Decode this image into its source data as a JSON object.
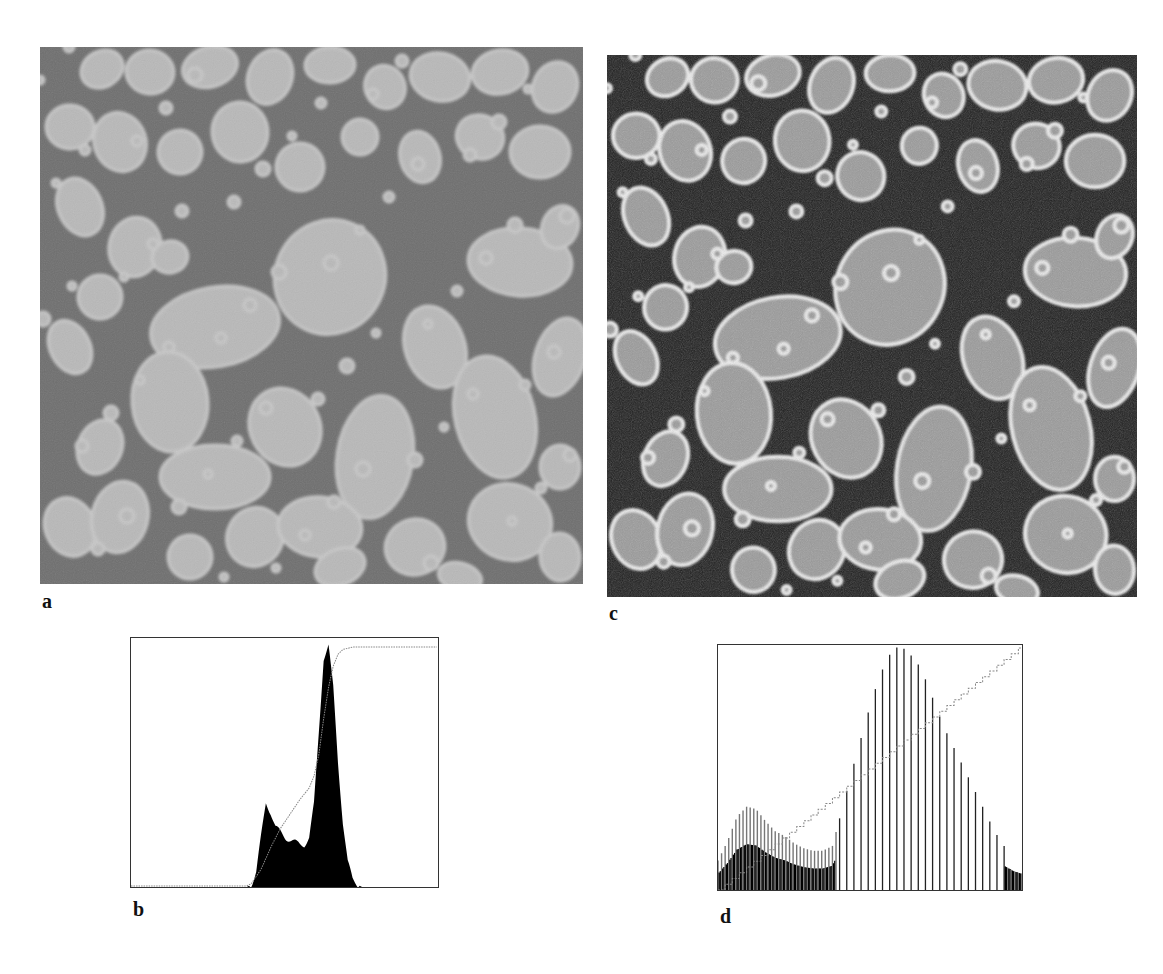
{
  "figure": {
    "panels": [
      {
        "id": "a",
        "label": "a",
        "kind": "micrograph",
        "description": "original grayscale image of grains, low contrast"
      },
      {
        "id": "b",
        "label": "b",
        "kind": "histogram",
        "description": "histogram of image a with cumulative curve"
      },
      {
        "id": "c",
        "label": "c",
        "kind": "micrograph",
        "description": "histogram-equalized image, high contrast"
      },
      {
        "id": "d",
        "label": "d",
        "kind": "histogram",
        "description": "histogram of image c (spiky, equalized) with linear cumulative curve"
      }
    ],
    "colors": {
      "background": "#ffffff",
      "matrix_a": "#6e6e6e",
      "grain_a": "#b9b9b9",
      "grain_edge_a": "#cfcfcf",
      "matrix_c": "#1c1c1c",
      "grain_c": "#9a9a9a",
      "grain_edge_c": "#eeeeee",
      "histogram_fill": "#000000",
      "cumulative_line": "#888888",
      "frame": "#333333"
    }
  },
  "chart_data": [
    {
      "panel": "b",
      "type": "bar",
      "title": "",
      "xlabel": "",
      "ylabel": "",
      "xlim": [
        0,
        255
      ],
      "ylim": [
        0,
        1
      ],
      "grid": false,
      "legend": null,
      "series": [
        {
          "name": "histogram",
          "x": [
            0,
            16,
            32,
            48,
            64,
            80,
            96,
            100,
            104,
            108,
            112,
            116,
            120,
            124,
            128,
            132,
            136,
            140,
            144,
            148,
            152,
            156,
            160,
            164,
            168,
            172,
            176,
            180,
            184,
            188,
            192,
            196,
            200,
            208,
            224,
            240,
            255
          ],
          "values": [
            0,
            0,
            0,
            0,
            0,
            0,
            0,
            0.01,
            0.06,
            0.2,
            0.34,
            0.3,
            0.24,
            0.22,
            0.2,
            0.19,
            0.18,
            0.17,
            0.17,
            0.2,
            0.33,
            0.62,
            0.92,
            0.97,
            0.8,
            0.5,
            0.26,
            0.1,
            0.03,
            0.01,
            0,
            0,
            0,
            0,
            0,
            0,
            0
          ]
        },
        {
          "name": "cumulative",
          "x": [
            0,
            96,
            100,
            108,
            116,
            124,
            132,
            140,
            148,
            152,
            156,
            160,
            164,
            168,
            172,
            176,
            184,
            192,
            208,
            255
          ],
          "values": [
            0,
            0,
            0.01,
            0.07,
            0.16,
            0.24,
            0.3,
            0.36,
            0.41,
            0.46,
            0.55,
            0.7,
            0.83,
            0.92,
            0.97,
            0.99,
            1.0,
            1.0,
            1.0,
            1.0
          ]
        }
      ]
    },
    {
      "panel": "d",
      "type": "bar",
      "title": "",
      "xlabel": "",
      "ylabel": "",
      "xlim": [
        0,
        255
      ],
      "ylim": [
        0,
        1
      ],
      "grid": false,
      "legend": null,
      "series": [
        {
          "name": "histogram_envelope",
          "x": [
            0,
            8,
            16,
            24,
            32,
            40,
            48,
            56,
            64,
            72,
            80,
            88,
            96,
            104,
            112,
            120,
            128,
            136,
            144,
            152,
            160,
            168,
            176,
            184,
            192,
            200,
            208,
            216,
            224,
            232,
            240,
            248,
            255
          ],
          "values": [
            0.12,
            0.2,
            0.3,
            0.34,
            0.33,
            0.28,
            0.24,
            0.22,
            0.19,
            0.17,
            0.16,
            0.16,
            0.18,
            0.33,
            0.48,
            0.62,
            0.76,
            0.88,
            0.96,
            1.0,
            0.97,
            0.92,
            0.84,
            0.73,
            0.64,
            0.56,
            0.48,
            0.4,
            0.32,
            0.24,
            0.18,
            0.14,
            0.12
          ]
        },
        {
          "name": "cumulative",
          "x": [
            0,
            255
          ],
          "values": [
            0,
            1
          ]
        }
      ]
    }
  ]
}
